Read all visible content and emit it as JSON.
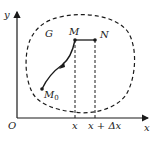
{
  "diagram": {
    "axes": {
      "x_label": "x",
      "y_label": "y",
      "origin_label": "O"
    },
    "region_label": "G",
    "points": {
      "start": {
        "label": "M",
        "subscript": "0"
      },
      "M": {
        "label": "M"
      },
      "N": {
        "label": "N"
      }
    },
    "ticks": {
      "x_tick": "x",
      "x_plus_dx_tick": "x + Δx"
    },
    "colors": {
      "stroke": "#1a1a1a",
      "background": "#ffffff"
    }
  }
}
